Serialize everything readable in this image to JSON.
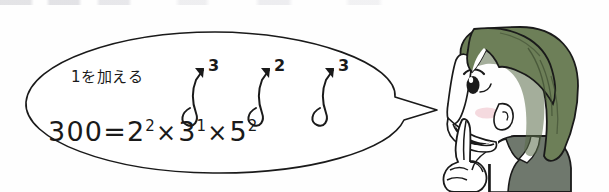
{
  "figure": {
    "caption_text": "1を加える",
    "equation": {
      "full": "300 = 2^2 × 3^1 × 5^2",
      "result": "300",
      "equals": "=",
      "factors": [
        {
          "base": "2",
          "exponent": "2",
          "new_exponent": "3"
        },
        {
          "base": "3",
          "exponent": "1",
          "new_exponent": "2"
        },
        {
          "base": "5",
          "exponent": "2",
          "new_exponent": "3"
        }
      ],
      "operator": "×"
    }
  },
  "annotations": {
    "arrows": [
      {
        "label": "3",
        "meaning": "exponent-2-plus-1"
      },
      {
        "label": "2",
        "meaning": "exponent-1-plus-1"
      },
      {
        "label": "3",
        "meaning": "exponent-2-plus-1"
      }
    ]
  },
  "character": {
    "description": "smiling girl pointing upward",
    "hair_color": "#6d7f58",
    "hair_shadow": "#4e5d3e",
    "skin_color": "#ffffff",
    "blush_color": "#f2cdd4",
    "clothing_color": "#6f786d",
    "collar_color": "#ffffff",
    "outline_color": "#1a1a1a"
  },
  "style": {
    "ink_color": "#1a1a1a",
    "bubble_fill": "#ffffff",
    "bubble_stroke": "#1a1a1a",
    "page_background": "#fefefe"
  }
}
